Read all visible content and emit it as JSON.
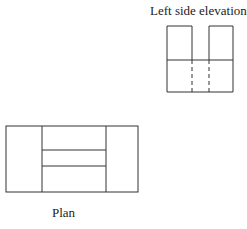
{
  "diagram": {
    "elevation": {
      "label": "Left side elevation",
      "outer": {
        "x": 167,
        "y": 26,
        "w": 66,
        "h": 66
      },
      "middle_line_y": 60,
      "top_verticals_x": [
        192,
        209
      ],
      "hidden_lines_x": [
        192,
        209
      ]
    },
    "plan": {
      "label": "Plan",
      "outer": {
        "x": 6,
        "y": 126,
        "w": 132,
        "h": 66
      },
      "inner_verticals_x": [
        42,
        106
      ],
      "inner_horizontals_y": [
        150,
        166
      ]
    },
    "stroke_color": "#333333"
  }
}
